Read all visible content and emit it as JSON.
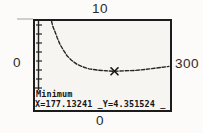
{
  "figure": {
    "kind": "graphing-calculator minimum screen",
    "window_labels": {
      "top": "10",
      "left": "0",
      "right": "300",
      "bottom": "0"
    },
    "screen": {
      "status_label": "Minimum",
      "readout_text": "X=177.13241 _Y=4.351524 _",
      "x_value": "177.13241",
      "y_value": "4.351524"
    },
    "colors": {
      "frame": "#1c1c1c",
      "screen_bg": "#f6f5f1",
      "ink": "#222222",
      "page_bg": "#fcfbf9"
    },
    "icons": {
      "minimum_cursor": "x-cross-cursor"
    }
  },
  "chart_data": {
    "type": "line",
    "title": "",
    "xlabel": "",
    "ylabel": "",
    "xlim": [
      0,
      300
    ],
    "ylim": [
      0,
      10
    ],
    "grid": false,
    "legend": "none",
    "axes": "y-axis with unit tick marks at left edge",
    "series": [
      {
        "name": "decreasing-then-flat curve (average-cost style)",
        "points": [
          [
            35,
            10
          ],
          [
            38,
            9.4
          ],
          [
            42,
            8.9
          ],
          [
            48,
            8.1
          ],
          [
            54,
            7.4
          ],
          [
            61,
            6.8
          ],
          [
            70,
            6.1
          ],
          [
            80,
            5.6
          ],
          [
            92,
            5.15
          ],
          [
            105,
            4.85
          ],
          [
            120,
            4.62
          ],
          [
            140,
            4.47
          ],
          [
            158,
            4.4
          ],
          [
            177.13,
            4.35
          ],
          [
            200,
            4.4
          ],
          [
            222,
            4.44
          ],
          [
            245,
            4.55
          ],
          [
            268,
            4.7
          ],
          [
            285,
            4.8
          ],
          [
            300,
            4.9
          ]
        ]
      }
    ],
    "minimum": {
      "x": 177.13241,
      "y": 4.351524,
      "label": "Minimum"
    },
    "annotations": [
      "Minimum",
      "X=177.13241",
      "Y=4.351524"
    ]
  }
}
